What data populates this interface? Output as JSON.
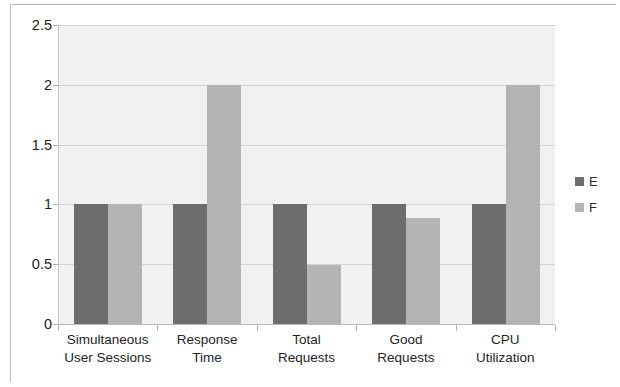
{
  "chart_data": {
    "type": "bar",
    "title": "",
    "subtitle": "",
    "xlabel": "",
    "ylabel": "",
    "categories": [
      "Simultaneous User Sessions",
      "Response Time",
      "Total Requests",
      "Good Requests",
      "CPU Utilization"
    ],
    "category_lines": [
      [
        "Simultaneous",
        "User Sessions"
      ],
      [
        "Response",
        "Time"
      ],
      [
        "Total",
        "Requests"
      ],
      [
        "Good",
        "Requests"
      ],
      [
        "CPU",
        "Utilization"
      ]
    ],
    "series": [
      {
        "name": "E",
        "color": "#6d6d6d",
        "values": [
          1,
          1,
          1,
          1,
          1
        ]
      },
      {
        "name": "F",
        "color": "#b4b4b4",
        "values": [
          1,
          2,
          0.49,
          0.89,
          2
        ]
      }
    ],
    "ylim": [
      0,
      2.5
    ],
    "yticks": [
      0,
      0.5,
      1,
      1.5,
      2,
      2.5
    ],
    "ytick_labels": [
      "0",
      "0.5",
      "1",
      "1.5",
      "2",
      "2.5"
    ],
    "grid": true,
    "grid_axis": "y",
    "legend_position": "right",
    "plot_background": "#f1f1f1",
    "gridline_color": "#d2d2d2"
  },
  "legend": {
    "entries": [
      {
        "label": "E"
      },
      {
        "label": "F"
      }
    ]
  }
}
